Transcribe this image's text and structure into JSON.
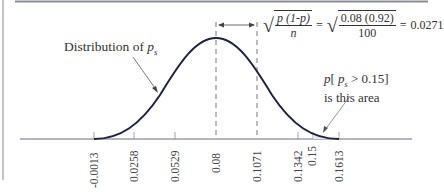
{
  "figure": {
    "colors": {
      "curve": "#1e2340",
      "axis": "#6b6f80",
      "border": "#8a8d99",
      "text": "#333333"
    }
  },
  "annotations": {
    "distribution_label_prefix": "Distribution of ",
    "distribution_label_var": "p",
    "distribution_label_sub": "s",
    "std_error_formula": {
      "num": "p (1-p)",
      "den": "n",
      "eq1": "=",
      "num2": "0.08 (0.92)",
      "den2": "100",
      "eq2": "=",
      "result": "0.0271"
    },
    "area_label_line1_p": "p",
    "area_label_line1_open": "[ ",
    "area_label_line1_var": "p",
    "area_label_line1_sub": "s",
    "area_label_line1_rest": " > 0.15]",
    "area_label_line2": "is this area"
  },
  "axis": {
    "ticks": [
      {
        "label": "-0.0013",
        "value": -0.0013
      },
      {
        "label": "0.0258",
        "value": 0.0258
      },
      {
        "label": "0.0529",
        "value": 0.0529
      },
      {
        "label": "0.08",
        "value": 0.08
      },
      {
        "label": "0.1071",
        "value": 0.1071
      },
      {
        "label": "0.1342",
        "value": 0.1342
      },
      {
        "label": "0.15",
        "value": 0.15
      },
      {
        "label": "0.1613",
        "value": 0.1613
      }
    ]
  }
}
